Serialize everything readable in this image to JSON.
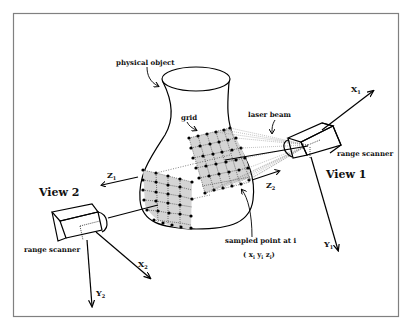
{
  "diagram": {
    "labels": {
      "physical_object": "physical object",
      "grid": "grid",
      "laser_beam": "laser beam",
      "range_scanner_1": "range scanner",
      "range_scanner_2": "range scanner",
      "view_1": "View 1",
      "view_2": "View 2",
      "sampled_point": "sampled point at i",
      "sampled_coords": "( x",
      "sampled_coords_full": "( xi yi zi )"
    },
    "axes": {
      "x1": "X",
      "y1": "Y",
      "z1": "Z",
      "x2": "X",
      "y2": "Y",
      "z2": "Z",
      "sub1": "1",
      "sub2": "2",
      "subi": "i"
    },
    "colors": {
      "background": "#ffffff",
      "frame": "#808080",
      "ink": "#000000",
      "grid_fill": "#d4d4d4"
    }
  }
}
